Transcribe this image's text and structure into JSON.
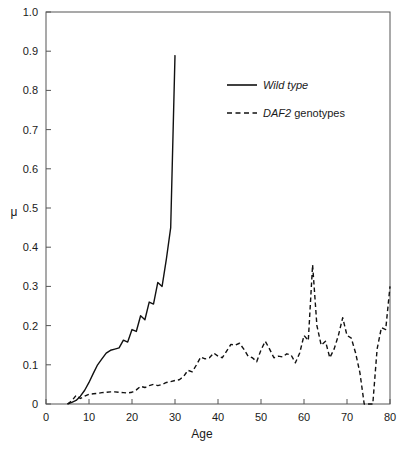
{
  "chart_data": {
    "type": "line",
    "title": "",
    "xlabel": "Age",
    "ylabel": "μ",
    "xlim": [
      0,
      80
    ],
    "ylim": [
      0,
      1.0
    ],
    "xticks": [
      0,
      10,
      20,
      30,
      40,
      50,
      60,
      70,
      80
    ],
    "xticklabels": [
      "0",
      "10",
      "20",
      "30",
      "40",
      "50",
      "60",
      "70",
      "80"
    ],
    "yticks": [
      0,
      0.1,
      0.2,
      0.3,
      0.4,
      0.5,
      0.6,
      0.7,
      0.8,
      0.9,
      1.0
    ],
    "yticklabels": [
      "0",
      "0.1",
      "0.2",
      "0.3",
      "0.4",
      "0.5",
      "0.6",
      "0.7",
      "0.8",
      "0.9",
      "1.0"
    ],
    "grid": false,
    "legend_position": "upper-center-right",
    "line_color": "#111111",
    "series": [
      {
        "name": "Wild type",
        "name_italic": true,
        "style": "solid",
        "x": [
          5,
          6,
          7,
          8,
          9,
          10,
          11,
          12,
          13,
          14,
          15,
          16,
          17,
          18,
          19,
          20,
          21,
          22,
          23,
          24,
          25,
          26,
          27,
          28,
          29,
          30
        ],
        "y": [
          0.0,
          0.004,
          0.009,
          0.02,
          0.035,
          0.055,
          0.078,
          0.1,
          0.115,
          0.13,
          0.137,
          0.14,
          0.143,
          0.163,
          0.158,
          0.19,
          0.185,
          0.225,
          0.215,
          0.26,
          0.255,
          0.31,
          0.3,
          0.37,
          0.45,
          0.89
        ]
      },
      {
        "name": "DAF2 genotypes",
        "name_italic_prefix": "DAF2",
        "name_normal_suffix": " genotypes",
        "style": "dashed",
        "x": [
          5,
          6,
          7,
          8,
          9,
          10,
          11,
          12,
          13,
          14,
          15,
          16,
          17,
          18,
          19,
          20,
          21,
          22,
          23,
          24,
          25,
          26,
          27,
          28,
          29,
          30,
          31,
          32,
          33,
          34,
          35,
          36,
          37,
          38,
          39,
          40,
          41,
          42,
          43,
          44,
          45,
          46,
          47,
          48,
          49,
          50,
          51,
          52,
          53,
          54,
          55,
          56,
          57,
          58,
          59,
          60,
          61,
          62,
          63,
          64,
          65,
          66,
          67,
          68,
          69,
          70,
          71,
          72,
          73,
          74,
          75,
          76,
          77,
          78,
          79,
          80
        ],
        "y": [
          0.0,
          0.008,
          0.022,
          0.014,
          0.02,
          0.025,
          0.026,
          0.027,
          0.029,
          0.03,
          0.031,
          0.031,
          0.03,
          0.029,
          0.028,
          0.03,
          0.036,
          0.045,
          0.042,
          0.047,
          0.05,
          0.047,
          0.05,
          0.055,
          0.057,
          0.06,
          0.062,
          0.07,
          0.086,
          0.082,
          0.1,
          0.12,
          0.115,
          0.118,
          0.13,
          0.122,
          0.118,
          0.135,
          0.152,
          0.15,
          0.155,
          0.14,
          0.122,
          0.118,
          0.108,
          0.138,
          0.16,
          0.14,
          0.118,
          0.122,
          0.12,
          0.128,
          0.125,
          0.105,
          0.13,
          0.175,
          0.162,
          0.355,
          0.2,
          0.15,
          0.16,
          0.118,
          0.14,
          0.175,
          0.22,
          0.175,
          0.168,
          0.13,
          0.08,
          0.0,
          0.0,
          0.0,
          0.14,
          0.195,
          0.19,
          0.3
        ]
      }
    ]
  },
  "legend": {
    "entries": [
      {
        "label": "Wild type",
        "style": "solid",
        "italic_part": "Wild type",
        "normal_part": ""
      },
      {
        "label": "DAF2 genotypes",
        "style": "dashed",
        "italic_part": "DAF2",
        "normal_part": " genotypes"
      }
    ]
  },
  "axes": {
    "x_axis_label": "Age",
    "y_axis_label": "μ"
  }
}
